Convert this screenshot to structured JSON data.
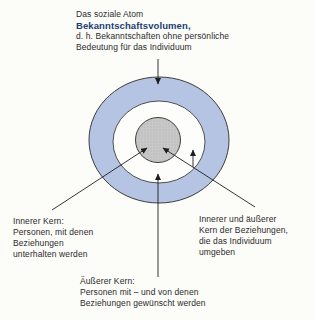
{
  "figure": {
    "title_block": {
      "line1": "Das soziale Atom",
      "line2": "Bekanntschaftsvolumen,",
      "line3": "d. h. Bekanntschaften ohne persönliche",
      "line4": "Bedeutung für das Individuum"
    },
    "labels": {
      "inner_core": {
        "lines": [
          "Innerer Kern:",
          "Personen, mit denen",
          "Beziehungen",
          "unterhalten werden"
        ]
      },
      "inner_and_outer_core": {
        "lines": [
          "Innerer und äußerer",
          "Kern der Beziehungen,",
          "die das Individuum",
          "umgeben"
        ]
      },
      "outer_core": {
        "lines": [
          "Äußerer Kern:",
          "Personen mit – und von denen",
          "Beziehungen gewünscht werden"
        ]
      }
    },
    "rings": [
      {
        "name": "outer-ring",
        "meaning": "Bekanntschaftsvolumen"
      },
      {
        "name": "white-ring",
        "meaning": "Äußerer Kern"
      },
      {
        "name": "inner-core",
        "meaning": "Innerer Kern"
      }
    ]
  },
  "colors": {
    "background": "#fcfcf9",
    "ring_fill": "#b5c4e2",
    "white_ring_fill": "#fdfdfb",
    "core_fill": "#c8c8c8",
    "core_dot": "#b9b9b9",
    "outline": "#3d3d3d",
    "arrow": "#1e1e1e",
    "heading_accent": "#1c3e74",
    "text": "#2b2b2b"
  }
}
